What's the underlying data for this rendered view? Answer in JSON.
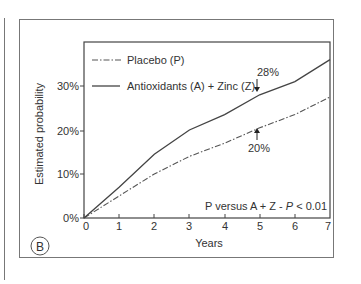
{
  "panel_label": "B",
  "chart_data": {
    "type": "line",
    "title": "",
    "xlabel": "Years",
    "ylabel": "Estimated probability",
    "x": [
      0,
      1,
      2,
      3,
      4,
      5,
      6,
      7
    ],
    "x_ticks": [
      "0",
      "1",
      "2",
      "3",
      "4",
      "5",
      "6",
      "7"
    ],
    "y_ticks": [
      "0%",
      "10%",
      "20%",
      "30%"
    ],
    "xlim": [
      0,
      7
    ],
    "ylim": [
      0,
      37
    ],
    "grid": false,
    "legend_position": "top-left",
    "series": [
      {
        "name": "Placebo (P)",
        "style": "dash-dot",
        "values": [
          0,
          5,
          10,
          14,
          17,
          20.5,
          23.5,
          27.5
        ]
      },
      {
        "name": "Antioxidants (A) + Zinc (Z)",
        "style": "solid",
        "values": [
          0,
          7,
          14.5,
          20,
          23.5,
          28,
          31,
          36
        ]
      }
    ],
    "annotations": [
      {
        "text": "28%",
        "x": 5,
        "y": 28,
        "arrow": "down"
      },
      {
        "text": "20%",
        "x": 5,
        "y": 20.5,
        "arrow": "up"
      },
      {
        "text": "P versus A + Z - P < 0.01",
        "position": "bottom-right"
      }
    ]
  },
  "legend": {
    "placebo": "Placebo (P)",
    "treatment": "Antioxidants (A) + Zinc (Z)"
  },
  "labels": {
    "xlabel": "Years",
    "ylabel": "Estimated probability",
    "annot_28": "28%",
    "annot_20": "20%",
    "stat_prefix": "P versus A + Z - ",
    "stat_p": "P",
    "stat_suffix": " < 0.01",
    "y0": "0%",
    "y10": "10%",
    "y20": "20%",
    "y30": "30%",
    "x0": "0",
    "x1": "1",
    "x2": "2",
    "x3": "3",
    "x4": "4",
    "x5": "5",
    "x6": "6",
    "x7": "7"
  }
}
